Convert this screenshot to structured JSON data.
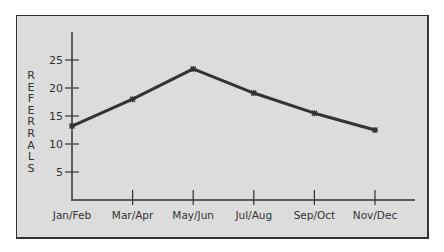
{
  "chart_data": {
    "type": "line",
    "title": "",
    "xlabel": "",
    "ylabel": "REFERRALS",
    "categories": [
      "Jan/Feb",
      "Mar/Apr",
      "May/Jun",
      "Jul/Aug",
      "Sep/Oct",
      "Nov/Dec"
    ],
    "series": [
      {
        "name": "Referrals",
        "values": [
          13.2,
          18.0,
          23.4,
          19.1,
          15.5,
          12.5
        ]
      }
    ],
    "yticks": [
      5,
      10,
      15,
      20,
      25
    ],
    "ylim": [
      0,
      30
    ],
    "grid": false,
    "legend": null,
    "colors": {
      "line": "#333333",
      "background": "#dcdcdc",
      "frame": "#333333"
    }
  }
}
